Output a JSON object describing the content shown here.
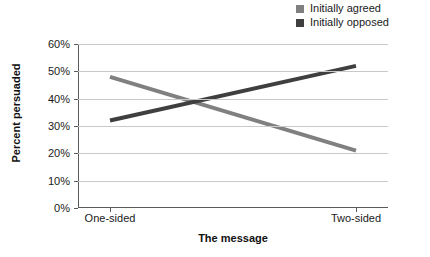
{
  "chart_data": {
    "type": "line",
    "title": "",
    "xlabel": "The message",
    "ylabel": "Percent persuaded",
    "categories": [
      "One-sided",
      "Two-sided"
    ],
    "series": [
      {
        "name": "Initially agreed",
        "values": [
          48,
          21
        ],
        "color": "#808080"
      },
      {
        "name": "Initially opposed",
        "values": [
          32,
          52
        ],
        "color": "#3f3f3f"
      }
    ],
    "ylim": [
      0,
      60
    ],
    "ytick_step": 10,
    "ytick_labels": [
      "0%",
      "10%",
      "20%",
      "30%",
      "40%",
      "50%",
      "60%"
    ],
    "ytick_values": [
      0,
      10,
      20,
      30,
      40,
      50,
      60
    ],
    "grid": "horizontal",
    "legend_position": "top-right",
    "legend_marker": "square",
    "value_suffix": "%"
  },
  "legend": {
    "items": [
      {
        "label": "Initially agreed",
        "color": "#808080"
      },
      {
        "label": "Initially opposed",
        "color": "#3f3f3f"
      }
    ]
  },
  "axes": {
    "y_title": "Percent persuaded",
    "x_title": "The message"
  },
  "colors": {
    "grid": "#c9c9c9",
    "axis": "#5a5a5a",
    "text": "#1a1a1a",
    "background": "#ffffff"
  }
}
